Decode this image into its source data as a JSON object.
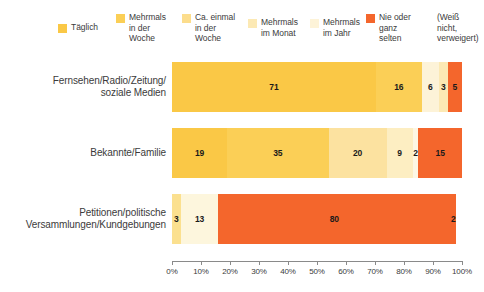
{
  "legend": {
    "items": [
      {
        "label": "Täglich",
        "color": "#fac846",
        "has_swatch": true,
        "x": 58,
        "y": 22
      },
      {
        "label": "Mehrmals\nin der\nWoche",
        "color": "#fbcf56",
        "has_swatch": true,
        "x": 116,
        "y": 12
      },
      {
        "label": "Ca. einmal\nin der\nWoche",
        "color": "#fcdd8c",
        "has_swatch": true,
        "x": 182,
        "y": 12
      },
      {
        "label": "Mehrmals\nim Monat",
        "color": "#fce9b4",
        "has_swatch": true,
        "x": 248,
        "y": 17
      },
      {
        "label": "Mehrmals\nim Jahr",
        "color": "#fdf3d8",
        "has_swatch": true,
        "x": 310,
        "y": 17
      },
      {
        "label": "Nie oder\nganz\nselten",
        "color": "#f4662c",
        "has_swatch": true,
        "x": 366,
        "y": 12
      },
      {
        "label": "(Weiß\nnicht,\nverweigert)",
        "color": "#ffffff",
        "has_swatch": false,
        "x": 424,
        "y": 12
      }
    ]
  },
  "chart_data": {
    "type": "bar",
    "orientation": "horizontal",
    "stacked": true,
    "normalized": true,
    "title": "",
    "subtitle": "",
    "xlabel": "",
    "ylabel": "",
    "xlim": [
      0,
      100
    ],
    "grid": false,
    "legend_position": "top",
    "xticks": [
      0,
      10,
      20,
      30,
      40,
      50,
      60,
      70,
      80,
      90,
      100
    ],
    "xticklabels": [
      "0%",
      "10%",
      "20%",
      "30%",
      "40%",
      "50%",
      "60%",
      "70%",
      "80%",
      "90%",
      "100%"
    ],
    "categories": [
      "Fernsehen/Radio/Zeitung/\nsoziale Medien",
      "Bekannte/Familie",
      "Petitionen/politische\nVersammlungen/Kundgebungen"
    ],
    "series": [
      {
        "name": "Täglich",
        "color": "#fac846",
        "values": [
          71,
          19,
          0
        ]
      },
      {
        "name": "Mehrmals in der Woche",
        "color": "#fbcf56",
        "values": [
          16,
          35,
          0
        ]
      },
      {
        "name": "Ca. einmal in der Woche",
        "color": "#fcdd8c",
        "values": [
          6,
          20,
          3
        ]
      },
      {
        "name": "Mehrmals im Monat",
        "color": "#fce9b4",
        "values": [
          3,
          9,
          13
        ]
      },
      {
        "name": "Mehrmals im Jahr",
        "color": "#fdf3d8",
        "values": [
          0,
          2,
          0
        ]
      },
      {
        "name": "Nie oder ganz selten",
        "color": "#f4662c",
        "values": [
          5,
          15,
          80
        ]
      },
      {
        "name": "(Weiß nicht, verweigert)",
        "color": "#ffffff",
        "values": [
          0,
          0,
          2
        ]
      }
    ],
    "rows": [
      {
        "label_line1": "Fernsehen/Radio/Zeitung/",
        "label_line2": "soziale Medien",
        "segments": [
          {
            "name": "Täglich",
            "value": 71,
            "display": "71",
            "color": "#fac846"
          },
          {
            "name": "Mehrmals in der Woche",
            "value": 16,
            "display": "16",
            "color": "#fbcf56"
          },
          {
            "name": "Ca. einmal in der Woche",
            "value": 6,
            "display": "6",
            "color": "#fdf3d8"
          },
          {
            "name": "Mehrmals im Monat",
            "value": 3,
            "display": "3",
            "color": "#fce9b4"
          },
          {
            "name": "Nie oder ganz selten",
            "value": 5,
            "display": "5",
            "color": "#f4662c"
          }
        ]
      },
      {
        "label_line1": "Bekannte/Familie",
        "label_line2": "",
        "segments": [
          {
            "name": "Täglich",
            "value": 19,
            "display": "19",
            "color": "#fac846"
          },
          {
            "name": "Mehrmals in der Woche",
            "value": 35,
            "display": "35",
            "color": "#fbcf56"
          },
          {
            "name": "Ca. einmal in der Woche",
            "value": 20,
            "display": "20",
            "color": "#fce2a0"
          },
          {
            "name": "Mehrmals im Monat",
            "value": 9,
            "display": "9",
            "color": "#fdeec2"
          },
          {
            "name": "Mehrmals im Jahr",
            "value": 2,
            "display": "2",
            "color": "#fdf7e4"
          },
          {
            "name": "Nie oder ganz selten",
            "value": 15,
            "display": "15",
            "color": "#f4662c"
          }
        ]
      },
      {
        "label_line1": "Petitionen/politische",
        "label_line2": "Versammlungen/Kundgebungen",
        "segments": [
          {
            "name": "Ca. einmal in der Woche",
            "value": 3,
            "display": "3",
            "color": "#fbe08f"
          },
          {
            "name": "Mehrmals im Monat",
            "value": 13,
            "display": "13",
            "color": "#fdf6dd"
          },
          {
            "name": "Nie oder ganz selten",
            "value": 80,
            "display": "80",
            "color": "#f4662c"
          },
          {
            "name": "(Weiß nicht, verweigert)",
            "value": 2,
            "display": "2",
            "color": "#f4662c"
          }
        ]
      }
    ]
  }
}
